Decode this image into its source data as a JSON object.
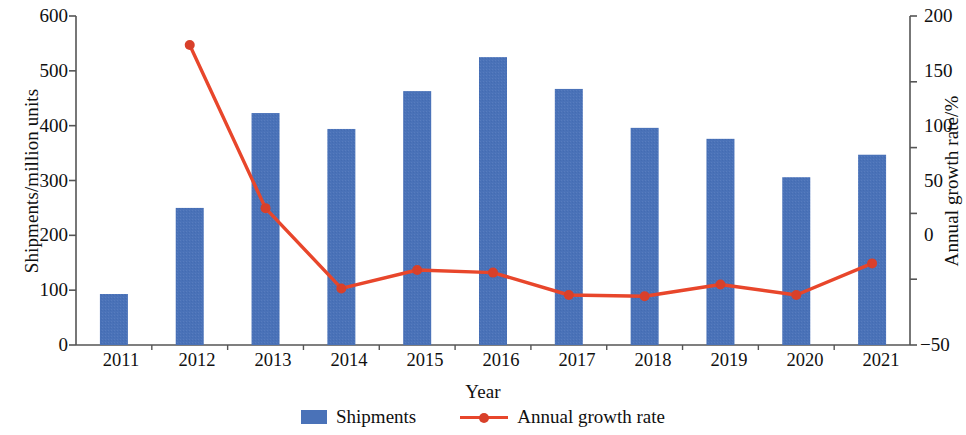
{
  "chart_data": {
    "type": "bar",
    "title": "",
    "xlabel": "Year",
    "ylabel": "Shipments/million units",
    "y2label": "Annual growth rate/%",
    "categories": [
      "2011",
      "2012",
      "2013",
      "2014",
      "2015",
      "2016",
      "2017",
      "2018",
      "2019",
      "2020",
      "2021"
    ],
    "ylim": [
      0,
      600
    ],
    "y2lim": [
      -50,
      200
    ],
    "yticks": [
      0,
      100,
      200,
      300,
      400,
      500,
      600
    ],
    "y2ticks": [
      -50,
      0,
      50,
      100,
      150,
      200
    ],
    "grid": false,
    "legend_position": "bottom",
    "series": [
      {
        "name": "Shipments",
        "type": "bar",
        "axis": "left",
        "color": "#4a72b8",
        "values": [
          93,
          250,
          423,
          394,
          463,
          525,
          467,
          396,
          376,
          306,
          347
        ]
      },
      {
        "name": "Annual growth rate",
        "type": "line",
        "axis": "right",
        "color": "#e8462b",
        "values": [
          null,
          178,
          54,
          -7,
          7,
          5,
          -12,
          -13,
          -4,
          -12,
          12
        ]
      }
    ]
  },
  "axes": {
    "left": {
      "title": "Shipments/million units",
      "ticks": [
        "0",
        "100",
        "200",
        "300",
        "400",
        "500",
        "600"
      ]
    },
    "right": {
      "title": "Annual growth rate/%",
      "ticks": [
        "−50",
        "0",
        "50",
        "100",
        "150",
        "200"
      ]
    },
    "bottom": {
      "title": "Year",
      "ticks": [
        "2011",
        "2012",
        "2013",
        "2014",
        "2015",
        "2016",
        "2017",
        "2018",
        "2019",
        "2020",
        "2021"
      ]
    }
  },
  "legend": {
    "items": [
      {
        "label": "Shipments",
        "marker": "bar-swatch",
        "color": "#4a72b8"
      },
      {
        "label": "Annual growth rate",
        "marker": "line-marker-swatch",
        "color": "#e8462b"
      }
    ]
  }
}
